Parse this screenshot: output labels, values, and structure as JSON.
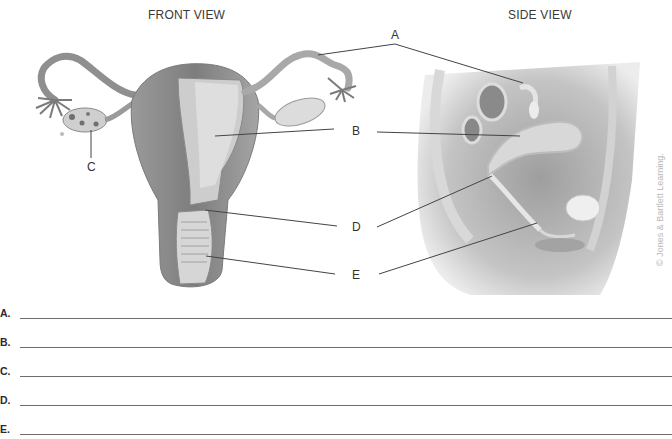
{
  "front_view": {
    "title": "FRONT VIEW",
    "labels": [
      "C"
    ]
  },
  "side_view": {
    "title": "SIDE VIEW"
  },
  "callouts": {
    "A": "A",
    "B": "B",
    "C": "C",
    "D": "D",
    "E": "E"
  },
  "copyright": "© Jones & Bartlett Learning.",
  "answers": [
    {
      "letter": "A.",
      "value": ""
    },
    {
      "letter": "B.",
      "value": ""
    },
    {
      "letter": "C.",
      "value": ""
    },
    {
      "letter": "D.",
      "value": ""
    },
    {
      "letter": "E.",
      "value": ""
    }
  ],
  "colors": {
    "line": "#444444",
    "tissue_dark": "#8a8a8a",
    "tissue_mid": "#b0b0b0",
    "tissue_light": "#d6d6d6"
  }
}
